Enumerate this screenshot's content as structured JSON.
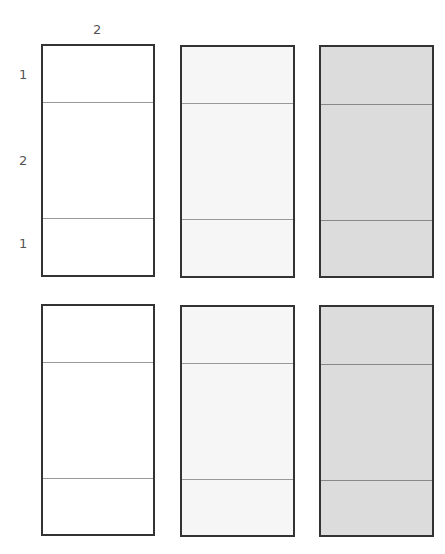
{
  "diagram": {
    "top_label": "2",
    "side_labels": [
      "1",
      "2",
      "1"
    ],
    "fills": {
      "white": "#ffffff",
      "light": "#f6f6f6",
      "gray": "#dcdcdc"
    },
    "rows": [
      {
        "panels": [
          {
            "fill": "white",
            "sections": [
              1,
              2,
              1
            ]
          },
          {
            "fill": "light",
            "sections": [
              1,
              2,
              1
            ]
          },
          {
            "fill": "gray",
            "sections": [
              1,
              2,
              1
            ]
          }
        ]
      },
      {
        "panels": [
          {
            "fill": "white",
            "sections": [
              1,
              2,
              1
            ]
          },
          {
            "fill": "light",
            "sections": [
              1,
              2,
              1
            ]
          },
          {
            "fill": "gray",
            "sections": [
              1,
              2,
              1
            ]
          }
        ]
      }
    ]
  }
}
